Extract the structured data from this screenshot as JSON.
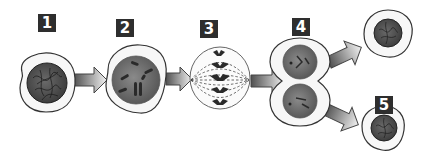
{
  "diagram": {
    "colors": {
      "label_bg": "#2e2e2e",
      "label_text": "#ffffff",
      "cell_outline": "#333333",
      "nucleus_fill": "#6e6e6e",
      "arrow_dark": "#555555",
      "arrow_light": "#eeeeee"
    },
    "stages": [
      {
        "label": "1",
        "name": "interphase",
        "description": "cell with nucleus containing tangled chromatin"
      },
      {
        "label": "2",
        "name": "prophase",
        "description": "cell with condensed chromosomes in nucleus"
      },
      {
        "label": "3",
        "name": "metaphase",
        "description": "spindle fibers with chromosomes aligned at center"
      },
      {
        "label": "4",
        "name": "telophase",
        "description": "dividing cell pinched into two with two nuclei"
      },
      {
        "label": "5",
        "name": "daughter-cells",
        "description": "two resulting daughter cells"
      }
    ],
    "arrows": [
      {
        "from": "1",
        "to": "2"
      },
      {
        "from": "2",
        "to": "3"
      },
      {
        "from": "3",
        "to": "4"
      },
      {
        "from": "4",
        "to": "5-top"
      },
      {
        "from": "4",
        "to": "5-bottom"
      }
    ]
  }
}
